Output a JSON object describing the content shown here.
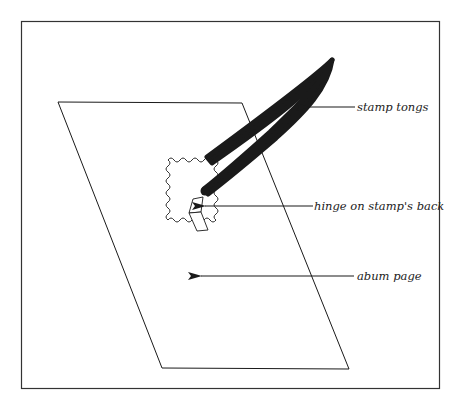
{
  "diagram": {
    "labels": {
      "tongs": "stamp tongs",
      "hinge": "hinge on stamp's back",
      "page": "abum page"
    },
    "colors": {
      "ink": "#1a1a1a",
      "background": "#ffffff"
    }
  }
}
